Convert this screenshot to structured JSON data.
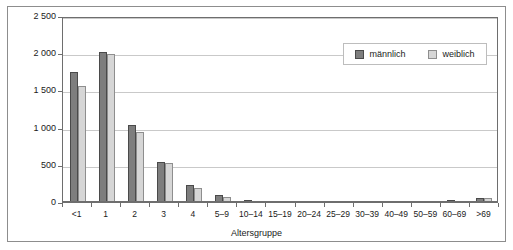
{
  "chart_data": {
    "type": "bar",
    "title": "",
    "xlabel": "Altersgruppe",
    "ylabel": "Erkrankungen/100 000 Einwohner",
    "ylim": [
      0,
      2500
    ],
    "yticks": [
      0,
      500,
      1000,
      1500,
      2000,
      2500
    ],
    "ytick_labels": [
      "0",
      "500",
      "1 000",
      "1 500",
      "2 000",
      "2 500"
    ],
    "grid": true,
    "legend_position": "top-right",
    "categories": [
      "<1",
      "1",
      "2",
      "3",
      "4",
      "5–9",
      "10–14",
      "15–19",
      "20–24",
      "25–29",
      "30–39",
      "40–49",
      "50–59",
      "60–69",
      ">69"
    ],
    "series": [
      {
        "name": "männlich",
        "color": "#7e7e7e",
        "values": [
          1750,
          2020,
          1040,
          540,
          235,
          100,
          22,
          14,
          12,
          12,
          12,
          12,
          14,
          22,
          60
        ]
      },
      {
        "name": "weiblich",
        "color": "#d6d6d6",
        "values": [
          1565,
          1990,
          940,
          520,
          195,
          70,
          16,
          10,
          10,
          10,
          10,
          10,
          12,
          16,
          48
        ]
      }
    ]
  },
  "legend": {
    "items": [
      {
        "label": "männlich"
      },
      {
        "label": "weiblich"
      }
    ]
  }
}
